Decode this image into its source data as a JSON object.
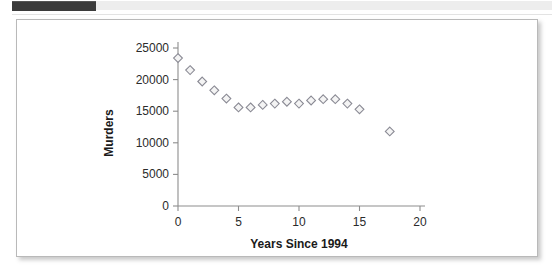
{
  "chrome": {
    "top_bar_label": "",
    "divider_label": ""
  },
  "chart_data": {
    "type": "scatter",
    "title": "",
    "xlabel": "Years Since 1994",
    "ylabel": "Murders",
    "xlim": [
      0,
      20
    ],
    "ylim": [
      0,
      25000
    ],
    "xticks": [
      0,
      5,
      10,
      15,
      20
    ],
    "yticks": [
      0,
      5000,
      10000,
      15000,
      20000,
      25000
    ],
    "xtick_labels": [
      "0",
      "5",
      "10",
      "15",
      "20"
    ],
    "ytick_labels": [
      "0",
      "5000",
      "10000",
      "15000",
      "20000",
      "25000"
    ],
    "grid": false,
    "legend": false,
    "marker": "diamond",
    "marker_fill": "#f4f4f4",
    "marker_edge": "#8a8a94",
    "series": [
      {
        "name": "Murders",
        "x": [
          0,
          1,
          2,
          3,
          4,
          5,
          6,
          7,
          8,
          9,
          10,
          11,
          12,
          13,
          14,
          15,
          17.5
        ],
        "y": [
          23400,
          21500,
          19700,
          18300,
          17000,
          15600,
          15600,
          16000,
          16200,
          16500,
          16200,
          16700,
          16900,
          16900,
          16200,
          15300,
          11800
        ]
      }
    ]
  }
}
